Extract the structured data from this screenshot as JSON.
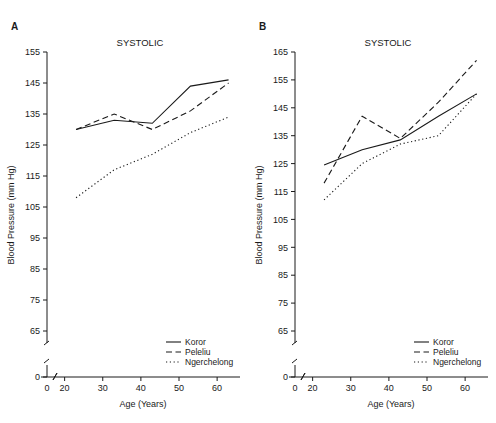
{
  "figure": {
    "width": 496,
    "height": 423,
    "background": "#ffffff",
    "ink_color": "#1a1a1a"
  },
  "panels": [
    {
      "id": "a",
      "label": "A",
      "title": "SYSTOLIC"
    },
    {
      "id": "b",
      "label": "B",
      "title": "SYSTOLIC"
    }
  ],
  "legend": {
    "position": "bottom-right",
    "entries": [
      {
        "label": "Koror",
        "style": "solid"
      },
      {
        "label": "Peleliu",
        "style": "dashed"
      },
      {
        "label": "Ngerchelong",
        "style": "dotted"
      }
    ]
  },
  "chart_data": [
    {
      "type": "line",
      "panel": "A",
      "title": "SYSTOLIC",
      "xlabel": "Age (Years)",
      "ylabel": "Blood Pressure (mm Hg)",
      "xlim": [
        18,
        66
      ],
      "ylim": [
        65,
        155
      ],
      "xticks": [
        0,
        20,
        30,
        40,
        50,
        60
      ],
      "yticks": [
        0,
        65,
        75,
        85,
        95,
        105,
        115,
        125,
        135,
        145,
        155
      ],
      "axis_break_x": true,
      "axis_break_y": true,
      "grid": false,
      "legend_position": "lower right",
      "x": [
        23,
        33,
        43,
        53,
        63
      ],
      "series": [
        {
          "name": "Koror",
          "style": "solid",
          "values": [
            130,
            133,
            132,
            144,
            146
          ]
        },
        {
          "name": "Peleliu",
          "style": "dashed",
          "values": [
            130,
            135,
            130,
            136,
            145
          ]
        },
        {
          "name": "Ngerchelong",
          "style": "dotted",
          "values": [
            108,
            117,
            122,
            129,
            134
          ]
        }
      ]
    },
    {
      "type": "line",
      "panel": "B",
      "title": "SYSTOLIC",
      "xlabel": "Age (Years)",
      "ylabel": "Blood Pressure (mm Hg)",
      "xlim": [
        18,
        66
      ],
      "ylim": [
        65,
        165
      ],
      "xticks": [
        0,
        20,
        30,
        40,
        50,
        60
      ],
      "yticks": [
        0,
        65,
        75,
        85,
        95,
        105,
        115,
        125,
        135,
        145,
        155,
        165
      ],
      "axis_break_x": true,
      "axis_break_y": true,
      "grid": false,
      "legend_position": "lower right",
      "x": [
        23,
        33,
        43,
        53,
        63
      ],
      "series": [
        {
          "name": "Koror",
          "style": "solid",
          "values": [
            124.5,
            130,
            133.5,
            142,
            150
          ]
        },
        {
          "name": "Peleliu",
          "style": "dashed",
          "values": [
            118,
            142,
            134,
            147,
            162
          ]
        },
        {
          "name": "Ngerchelong",
          "style": "dotted",
          "values": [
            112,
            125,
            132,
            135,
            150
          ]
        }
      ]
    }
  ]
}
